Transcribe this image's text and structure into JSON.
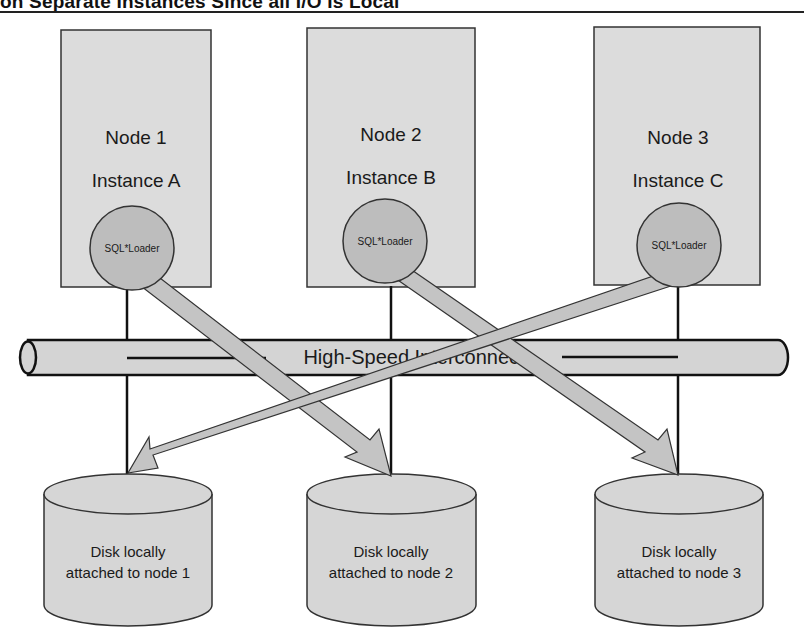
{
  "figure": {
    "title_fragment": "on Separate Instances Since all I/O Is Local",
    "interconnect_label": "High-Speed Interconnect",
    "colors": {
      "box_fill": "#dcdcdc",
      "circle_fill": "#bdbdbd",
      "arrow_fill": "#c4c4c4",
      "disk_fill": "#d6d6d6",
      "stroke": "#1a1a1a",
      "background": "#ffffff"
    }
  },
  "nodes": [
    {
      "node_label": "Node 1",
      "instance_label": "Instance A",
      "process_label": "SQL*Loader"
    },
    {
      "node_label": "Node 2",
      "instance_label": "Instance B",
      "process_label": "SQL*Loader"
    },
    {
      "node_label": "Node 3",
      "instance_label": "Instance C",
      "process_label": "SQL*Loader"
    }
  ],
  "disks": [
    {
      "line1": "Disk locally",
      "line2": "attached to node 1"
    },
    {
      "line1": "Disk locally",
      "line2": "attached to node 2"
    },
    {
      "line1": "Disk locally",
      "line2": "attached to node 3"
    }
  ],
  "data_flows": [
    {
      "from": "Node 1 SQL*Loader",
      "to": "Disk locally attached to node 2"
    },
    {
      "from": "Node 2 SQL*Loader",
      "to": "Disk locally attached to node 3"
    },
    {
      "from": "Node 3 SQL*Loader",
      "to": "Disk locally attached to node 1"
    }
  ]
}
